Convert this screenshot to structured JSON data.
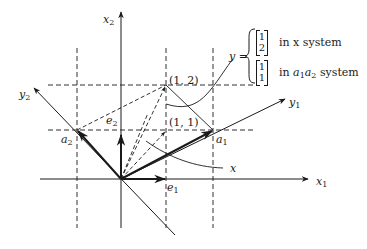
{
  "figure": {
    "axes": {
      "x1_label": "x",
      "x1_sub": "1",
      "x2_label": "x",
      "x2_sub": "2",
      "y1_label": "y",
      "y1_sub": "1",
      "y2_label": "y",
      "y2_sub": "2"
    },
    "vectors": {
      "e1_label": "e",
      "e1_sub": "1",
      "e2_label": "e",
      "e2_sub": "2",
      "a1_label": "a",
      "a1_sub": "1",
      "a2_label": "a",
      "a2_sub": "2",
      "x_label": "x"
    },
    "points": {
      "p12": "(1, 2)",
      "p11": "(1, 1)"
    },
    "annotation": {
      "y_eq": "y =",
      "x_system": {
        "col": [
          "1",
          "2"
        ],
        "text": "in x system"
      },
      "a_system": {
        "col": [
          "1",
          "1"
        ],
        "text_prefix": "in ",
        "text_a1": "a",
        "text_a1_sub": "1",
        "text_a2": "a",
        "text_a2_sub": "2",
        "text_suffix": " system"
      }
    },
    "colors": {
      "ink": "#1a1a1a",
      "background": "#ffffff"
    }
  }
}
